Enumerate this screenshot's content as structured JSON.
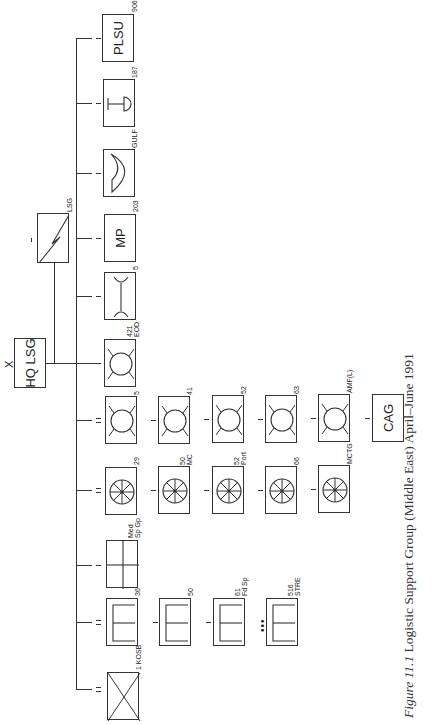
{
  "diagram": {
    "title_caption": {
      "figure_label": "Figure 11.1",
      "text": "Logistic Support Group (Middle East) April–June 1991"
    },
    "hq": {
      "echelon": "X",
      "label": "HQ LSG"
    },
    "lsg": {
      "label": "LSG"
    },
    "units": {
      "plsu": {
        "label": "PLSU",
        "number": "906"
      },
      "u187": {
        "number": "187"
      },
      "gulf": {
        "number": "GULF"
      },
      "mp": {
        "label": "MP",
        "number": "203"
      },
      "u5a": {
        "number": "5"
      },
      "eod": {
        "number": "421",
        "sub": "EOD"
      },
      "u5b": {
        "number": "5"
      },
      "u41": {
        "number": "41"
      },
      "u52a": {
        "number": "52"
      },
      "u63": {
        "number": "63"
      },
      "amf": {
        "number": "AMF(L)"
      },
      "cag": {
        "label": "CAG"
      },
      "u29": {
        "number": "29"
      },
      "u50mc": {
        "number": "50",
        "sub": "MC"
      },
      "u52port": {
        "number": "52",
        "sub": "Port"
      },
      "u66": {
        "number": "66"
      },
      "mctg": {
        "number": "MCTG"
      },
      "medsp": {
        "number": "Med",
        "sub": "Sp Gp"
      },
      "u36": {
        "number": "36"
      },
      "u50": {
        "number": "50"
      },
      "u61": {
        "number": "61",
        "sub": "Fd Sp"
      },
      "u516": {
        "number": "516",
        "sub": "STRE"
      },
      "kosb": {
        "number": "1 KOSB"
      }
    },
    "ellipsis": "•••"
  }
}
